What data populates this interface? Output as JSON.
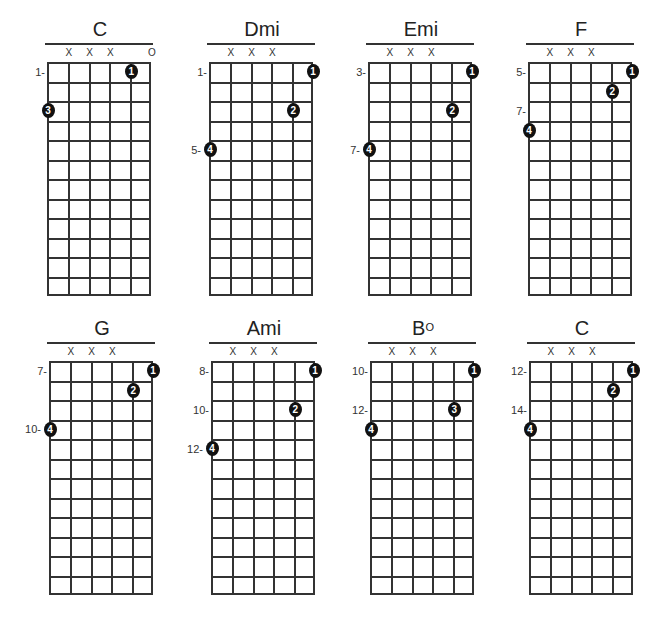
{
  "diagram": {
    "type": "guitar-chord-chart",
    "strings": 6,
    "frets_shown": 12,
    "colors": {
      "line": "#333333",
      "dot": "#111111",
      "dot_text": "#ffffff",
      "background": "#ffffff"
    },
    "chords": [
      {
        "name": "C",
        "sup": "",
        "left": 46,
        "top": 18,
        "markers": [
          {
            "string": 2,
            "text": "X"
          },
          {
            "string": 3,
            "text": "X"
          },
          {
            "string": 4,
            "text": "X"
          },
          {
            "string": 6,
            "text": "O"
          }
        ],
        "fret_labels": [
          {
            "row": 1,
            "text": "1-"
          }
        ],
        "dots": [
          {
            "string": 5,
            "row": 1,
            "finger": "1"
          },
          {
            "string": 1,
            "row": 3,
            "finger": "3"
          }
        ]
      },
      {
        "name": "Dmi",
        "sup": "",
        "left": 208,
        "top": 18,
        "markers": [
          {
            "string": 2,
            "text": "X"
          },
          {
            "string": 3,
            "text": "X"
          },
          {
            "string": 4,
            "text": "X"
          }
        ],
        "fret_labels": [
          {
            "row": 1,
            "text": "1-"
          },
          {
            "row": 5,
            "text": "5-"
          }
        ],
        "dots": [
          {
            "string": 6,
            "row": 1,
            "finger": "1"
          },
          {
            "string": 5,
            "row": 3,
            "finger": "2"
          },
          {
            "string": 1,
            "row": 5,
            "finger": "4"
          }
        ]
      },
      {
        "name": "Emi",
        "sup": "",
        "left": 367,
        "top": 18,
        "markers": [
          {
            "string": 2,
            "text": "X"
          },
          {
            "string": 3,
            "text": "X"
          },
          {
            "string": 4,
            "text": "X"
          }
        ],
        "fret_labels": [
          {
            "row": 1,
            "text": "3-"
          },
          {
            "row": 5,
            "text": "7-"
          }
        ],
        "dots": [
          {
            "string": 6,
            "row": 1,
            "finger": "1"
          },
          {
            "string": 5,
            "row": 3,
            "finger": "2"
          },
          {
            "string": 1,
            "row": 5,
            "finger": "4"
          }
        ]
      },
      {
        "name": "F",
        "sup": "",
        "left": 527,
        "top": 18,
        "markers": [
          {
            "string": 2,
            "text": "X"
          },
          {
            "string": 3,
            "text": "X"
          },
          {
            "string": 4,
            "text": "X"
          }
        ],
        "fret_labels": [
          {
            "row": 1,
            "text": "5-"
          },
          {
            "row": 3,
            "text": "7-"
          }
        ],
        "dots": [
          {
            "string": 6,
            "row": 1,
            "finger": "1"
          },
          {
            "string": 5,
            "row": 2,
            "finger": "2"
          },
          {
            "string": 1,
            "row": 4,
            "finger": "4"
          }
        ]
      },
      {
        "name": "G",
        "sup": "",
        "left": 48,
        "top": 317,
        "markers": [
          {
            "string": 2,
            "text": "X"
          },
          {
            "string": 3,
            "text": "X"
          },
          {
            "string": 4,
            "text": "X"
          }
        ],
        "fret_labels": [
          {
            "row": 1,
            "text": "7-"
          },
          {
            "row": 4,
            "text": "10-"
          }
        ],
        "dots": [
          {
            "string": 6,
            "row": 1,
            "finger": "1"
          },
          {
            "string": 5,
            "row": 2,
            "finger": "2"
          },
          {
            "string": 1,
            "row": 4,
            "finger": "4"
          }
        ]
      },
      {
        "name": "Ami",
        "sup": "",
        "left": 210,
        "top": 317,
        "markers": [
          {
            "string": 2,
            "text": "X"
          },
          {
            "string": 3,
            "text": "X"
          },
          {
            "string": 4,
            "text": "X"
          }
        ],
        "fret_labels": [
          {
            "row": 1,
            "text": "8-"
          },
          {
            "row": 3,
            "text": "10-"
          },
          {
            "row": 5,
            "text": "12-"
          }
        ],
        "dots": [
          {
            "string": 6,
            "row": 1,
            "finger": "1"
          },
          {
            "string": 5,
            "row": 3,
            "finger": "2"
          },
          {
            "string": 1,
            "row": 5,
            "finger": "4"
          }
        ]
      },
      {
        "name": "B",
        "sup": "O",
        "left": 369,
        "top": 317,
        "markers": [
          {
            "string": 2,
            "text": "X"
          },
          {
            "string": 3,
            "text": "X"
          },
          {
            "string": 4,
            "text": "X"
          }
        ],
        "fret_labels": [
          {
            "row": 1,
            "text": "10-"
          },
          {
            "row": 3,
            "text": "12-"
          }
        ],
        "dots": [
          {
            "string": 6,
            "row": 1,
            "finger": "1"
          },
          {
            "string": 5,
            "row": 3,
            "finger": "3"
          },
          {
            "string": 1,
            "row": 4,
            "finger": "4"
          }
        ]
      },
      {
        "name": "C",
        "sup": "",
        "left": 528,
        "top": 317,
        "markers": [
          {
            "string": 2,
            "text": "X"
          },
          {
            "string": 3,
            "text": "X"
          },
          {
            "string": 4,
            "text": "X"
          }
        ],
        "fret_labels": [
          {
            "row": 1,
            "text": "12-"
          },
          {
            "row": 3,
            "text": "14-"
          }
        ],
        "dots": [
          {
            "string": 6,
            "row": 1,
            "finger": "1"
          },
          {
            "string": 5,
            "row": 2,
            "finger": "2"
          },
          {
            "string": 1,
            "row": 4,
            "finger": "4"
          }
        ]
      }
    ]
  }
}
